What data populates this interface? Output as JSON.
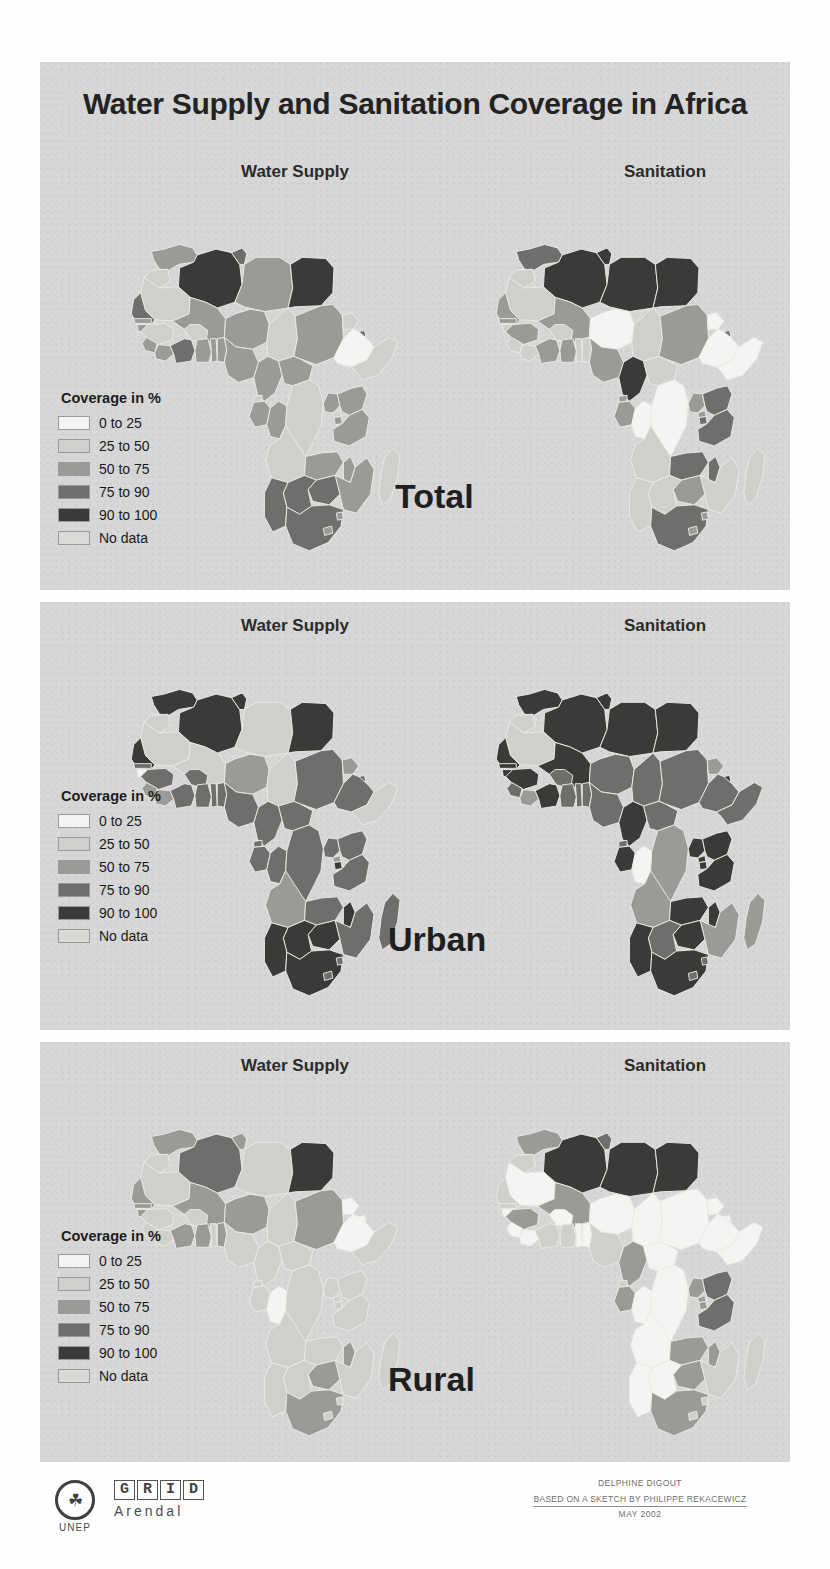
{
  "title": "Water Supply and Sanitation Coverage in Africa",
  "columns": {
    "water": "Water Supply",
    "sanitation": "Sanitation"
  },
  "legend": {
    "title": "Coverage in %",
    "items": [
      {
        "label": "0 to 25",
        "color": "#f4f4f2"
      },
      {
        "label": "25 to 50",
        "color": "#cfcfcb"
      },
      {
        "label": "50 to 75",
        "color": "#9a9a97"
      },
      {
        "label": "75 to 90",
        "color": "#6e6e6c"
      },
      {
        "label": "90 to 100",
        "color": "#3a3a39"
      },
      {
        "label": "No data",
        "color": "#d9d9d5"
      }
    ]
  },
  "panels": [
    {
      "id": "total",
      "label": "Total"
    },
    {
      "id": "urban",
      "label": "Urban"
    },
    {
      "id": "rural",
      "label": "Rural"
    }
  ],
  "credits": {
    "author": "DELPHINE DIGOUT",
    "source": "BASED ON A SKETCH BY PHILIPPE REKACEWICZ",
    "date": "MAY 2002"
  },
  "logo": {
    "unep": "UNEP",
    "grid": [
      "G",
      "R",
      "I",
      "D"
    ],
    "arendal": "Arendal"
  },
  "chart_data": {
    "type": "map",
    "title": "Water Supply and Sanitation Coverage in Africa",
    "unit": "percent of population covered",
    "legend_bins": [
      "0 to 25",
      "25 to 50",
      "50 to 75",
      "75 to 90",
      "90 to 100",
      "No data"
    ],
    "bin_colors": [
      "#f4f4f2",
      "#cfcfcb",
      "#9a9a97",
      "#6e6e6c",
      "#3a3a39",
      "#d9d9d5"
    ],
    "panels": [
      "Total",
      "Urban",
      "Rural"
    ],
    "indicators": [
      "Water Supply",
      "Sanitation"
    ],
    "values": {
      "total": {
        "water": {
          "MA": "50 to 75",
          "DZ": "90 to 100",
          "TN": "75 to 90",
          "LY": "50 to 75",
          "EG": "90 to 100",
          "EH": "25 to 50",
          "MR": "25 to 50",
          "ML": "50 to 75",
          "NE": "50 to 75",
          "TD": "25 to 50",
          "SD": "50 to 75",
          "ER": "25 to 50",
          "ET": "0 to 25",
          "DJ": "75 to 90",
          "SO": "25 to 50",
          "SN": "75 to 90",
          "GM": "50 to 75",
          "GW": "50 to 75",
          "GN": "25 to 50",
          "SL": "50 to 75",
          "LR": "50 to 75",
          "CI": "75 to 90",
          "GH": "50 to 75",
          "TG": "50 to 75",
          "BJ": "50 to 75",
          "NG": "50 to 75",
          "BF": "25 to 50",
          "CM": "50 to 75",
          "CF": "50 to 75",
          "GQ": "25 to 50",
          "GA": "50 to 75",
          "CG": "50 to 75",
          "CD": "25 to 50",
          "AO": "25 to 50",
          "UG": "50 to 75",
          "KE": "50 to 75",
          "RW": "25 to 50",
          "BI": "50 to 75",
          "TZ": "50 to 75",
          "ZM": "50 to 75",
          "MW": "50 to 75",
          "MZ": "50 to 75",
          "ZW": "75 to 90",
          "BW": "75 to 90",
          "NA": "75 to 90",
          "ZA": "75 to 90",
          "LS": "50 to 75",
          "SZ": "50 to 75",
          "MG": "25 to 50"
        },
        "sanitation": {
          "MA": "75 to 90",
          "DZ": "90 to 100",
          "TN": "90 to 100",
          "LY": "90 to 100",
          "EG": "90 to 100",
          "EH": "25 to 50",
          "MR": "25 to 50",
          "ML": "50 to 75",
          "NE": "0 to 25",
          "TD": "25 to 50",
          "SD": "50 to 75",
          "ER": "0 to 25",
          "ET": "0 to 25",
          "DJ": "75 to 90",
          "SO": "0 to 25",
          "SN": "50 to 75",
          "GM": "50 to 75",
          "GW": "25 to 50",
          "GN": "50 to 75",
          "SL": "25 to 50",
          "LR": "25 to 50",
          "CI": "50 to 75",
          "GH": "50 to 75",
          "TG": "25 to 50",
          "BJ": "25 to 50",
          "NG": "50 to 75",
          "BF": "25 to 50",
          "CM": "90 to 100",
          "CF": "25 to 50",
          "GQ": "50 to 75",
          "GA": "50 to 75",
          "CG": "0 to 25",
          "CD": "0 to 25",
          "AO": "25 to 50",
          "UG": "50 to 75",
          "KE": "75 to 90",
          "RW": "50 to 75",
          "BI": "75 to 90",
          "TZ": "75 to 90",
          "ZM": "75 to 90",
          "MW": "75 to 90",
          "MZ": "25 to 50",
          "ZW": "50 to 75",
          "BW": "25 to 50",
          "NA": "25 to 50",
          "ZA": "75 to 90",
          "LS": "50 to 75",
          "SZ": "50 to 75",
          "MG": "25 to 50"
        }
      },
      "urban": {
        "water": {
          "MA": "90 to 100",
          "DZ": "90 to 100",
          "TN": "90 to 100",
          "LY": "25 to 50",
          "EG": "90 to 100",
          "EH": "25 to 50",
          "MR": "25 to 50",
          "ML": "25 to 50",
          "NE": "50 to 75",
          "TD": "25 to 50",
          "SD": "75 to 90",
          "ER": "50 to 75",
          "ET": "75 to 90",
          "DJ": "75 to 90",
          "SO": "25 to 50",
          "SN": "90 to 100",
          "GM": "75 to 90",
          "GW": "0 to 25",
          "GN": "75 to 90",
          "SL": "50 to 75",
          "LR": "50 to 75",
          "CI": "75 to 90",
          "GH": "75 to 90",
          "TG": "75 to 90",
          "BJ": "75 to 90",
          "NG": "75 to 90",
          "BF": "75 to 90",
          "CM": "75 to 90",
          "CF": "75 to 90",
          "GQ": "75 to 90",
          "GA": "75 to 90",
          "CG": "75 to 90",
          "CD": "75 to 90",
          "AO": "50 to 75",
          "UG": "75 to 90",
          "KE": "75 to 90",
          "RW": "50 to 75",
          "BI": "90 to 100",
          "TZ": "75 to 90",
          "ZM": "75 to 90",
          "MW": "90 to 100",
          "MZ": "75 to 90",
          "ZW": "90 to 100",
          "BW": "90 to 100",
          "NA": "90 to 100",
          "ZA": "90 to 100",
          "LS": "75 to 90",
          "SZ": "75 to 90",
          "MG": "75 to 90"
        },
        "sanitation": {
          "MA": "90 to 100",
          "DZ": "90 to 100",
          "TN": "90 to 100",
          "LY": "90 to 100",
          "EG": "90 to 100",
          "EH": "25 to 50",
          "MR": "25 to 50",
          "ML": "90 to 100",
          "NE": "75 to 90",
          "TD": "75 to 90",
          "SD": "75 to 90",
          "ER": "50 to 75",
          "ET": "75 to 90",
          "DJ": "90 to 100",
          "SO": "75 to 90",
          "SN": "90 to 100",
          "GM": "90 to 100",
          "GW": "90 to 100",
          "GN": "90 to 100",
          "SL": "75 to 90",
          "LR": "50 to 75",
          "CI": "90 to 100",
          "GH": "75 to 90",
          "TG": "75 to 90",
          "BJ": "75 to 90",
          "NG": "75 to 90",
          "BF": "75 to 90",
          "CM": "90 to 100",
          "CF": "75 to 90",
          "GQ": "75 to 90",
          "GA": "90 to 100",
          "CG": "0 to 25",
          "CD": "50 to 75",
          "AO": "50 to 75",
          "UG": "90 to 100",
          "KE": "90 to 100",
          "RW": "90 to 100",
          "BI": "90 to 100",
          "TZ": "90 to 100",
          "ZM": "90 to 100",
          "MW": "90 to 100",
          "MZ": "50 to 75",
          "ZW": "90 to 100",
          "BW": "75 to 90",
          "NA": "90 to 100",
          "ZA": "90 to 100",
          "LS": "75 to 90",
          "SZ": "75 to 90",
          "MG": "50 to 75"
        }
      },
      "rural": {
        "water": {
          "MA": "50 to 75",
          "DZ": "75 to 90",
          "TN": "50 to 75",
          "LY": "25 to 50",
          "EG": "90 to 100",
          "EH": "25 to 50",
          "MR": "25 to 50",
          "ML": "50 to 75",
          "NE": "50 to 75",
          "TD": "25 to 50",
          "SD": "50 to 75",
          "ER": "0 to 25",
          "ET": "0 to 25",
          "DJ": "0 to 25",
          "SO": "25 to 50",
          "SN": "50 to 75",
          "GM": "50 to 75",
          "GW": "50 to 75",
          "GN": "25 to 50",
          "SL": "25 to 50",
          "LR": "25 to 50",
          "CI": "50 to 75",
          "GH": "50 to 75",
          "TG": "25 to 50",
          "BJ": "50 to 75",
          "NG": "25 to 50",
          "BF": "25 to 50",
          "CM": "25 to 50",
          "CF": "25 to 50",
          "GQ": "25 to 50",
          "GA": "25 to 50",
          "CG": "0 to 25",
          "CD": "25 to 50",
          "AO": "25 to 50",
          "UG": "25 to 50",
          "KE": "25 to 50",
          "RW": "25 to 50",
          "BI": "25 to 50",
          "TZ": "25 to 50",
          "ZM": "25 to 50",
          "MW": "50 to 75",
          "MZ": "25 to 50",
          "ZW": "50 to 75",
          "BW": "25 to 50",
          "NA": "25 to 50",
          "ZA": "50 to 75",
          "LS": "25 to 50",
          "SZ": "25 to 50",
          "MG": "25 to 50"
        },
        "sanitation": {
          "MA": "50 to 75",
          "DZ": "90 to 100",
          "TN": "75 to 90",
          "LY": "90 to 100",
          "EG": "90 to 100",
          "EH": "25 to 50",
          "MR": "0 to 25",
          "ML": "50 to 75",
          "NE": "0 to 25",
          "TD": "0 to 25",
          "SD": "0 to 25",
          "ER": "0 to 25",
          "ET": "0 to 25",
          "DJ": "0 to 25",
          "SO": "0 to 25",
          "SN": "25 to 50",
          "GM": "25 to 50",
          "GW": "0 to 25",
          "GN": "50 to 75",
          "SL": "0 to 25",
          "LR": "0 to 25",
          "CI": "25 to 50",
          "GH": "25 to 50",
          "TG": "0 to 25",
          "BJ": "0 to 25",
          "NG": "25 to 50",
          "BF": "0 to 25",
          "CM": "50 to 75",
          "CF": "0 to 25",
          "GQ": "25 to 50",
          "GA": "50 to 75",
          "CG": "0 to 25",
          "CD": "0 to 25",
          "AO": "0 to 25",
          "UG": "50 to 75",
          "KE": "75 to 90",
          "RW": "50 to 75",
          "BI": "50 to 75",
          "TZ": "75 to 90",
          "ZM": "50 to 75",
          "MW": "50 to 75",
          "MZ": "25 to 50",
          "ZW": "50 to 75",
          "BW": "0 to 25",
          "NA": "0 to 25",
          "ZA": "50 to 75",
          "LS": "25 to 50",
          "SZ": "25 to 50",
          "MG": "25 to 50"
        }
      }
    }
  }
}
